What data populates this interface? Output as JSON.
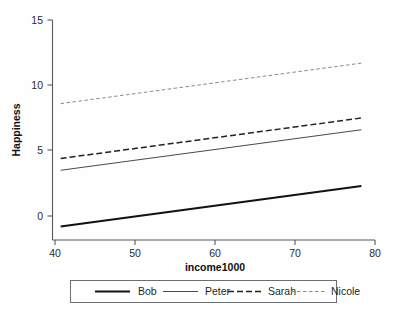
{
  "chart_data": {
    "type": "line",
    "title": "",
    "subtitle": "",
    "xlabel": "income1000",
    "ylabel": "Happiness",
    "xlim": [
      40,
      80
    ],
    "ylim": [
      -1.2,
      15
    ],
    "xticks": [
      40,
      50,
      60,
      70,
      80
    ],
    "yticks": [
      0,
      5,
      10,
      15
    ],
    "xtick_labels": [
      "40",
      "50",
      "60",
      "70",
      "80"
    ],
    "ytick_labels": [
      "0",
      "5",
      "10",
      "15"
    ],
    "grid": false,
    "legend_position": "bottom",
    "x_range_drawn": [
      40.7,
      78.3
    ],
    "series": [
      {
        "name": "Bob",
        "style": "solid",
        "width": 2.0,
        "color": "#111111",
        "x": [
          40.7,
          78.3
        ],
        "values": [
          -0.8,
          2.3
        ]
      },
      {
        "name": "Peter",
        "style": "solid",
        "width": 1.0,
        "color": "#4a4a4a",
        "x": [
          40.7,
          78.3
        ],
        "values": [
          3.5,
          6.6
        ]
      },
      {
        "name": "Sarah",
        "style": "dashed",
        "width": 1.5,
        "color": "#222222",
        "x": [
          40.7,
          78.3
        ],
        "values": [
          4.4,
          7.5
        ]
      },
      {
        "name": "Nicole",
        "style": "dotted",
        "width": 1.0,
        "color": "#8a8a8a",
        "x": [
          40.7,
          78.3
        ],
        "values": [
          8.6,
          11.7
        ]
      }
    ]
  },
  "axes": {
    "x_title": "income1000",
    "y_title": "Happiness",
    "x_tick_0": "40",
    "x_tick_1": "50",
    "x_tick_2": "60",
    "x_tick_3": "70",
    "x_tick_4": "80",
    "y_tick_0": "0",
    "y_tick_1": "5",
    "y_tick_2": "10",
    "y_tick_3": "15"
  },
  "legend": {
    "entries": [
      {
        "label": "Bob"
      },
      {
        "label": "Peter"
      },
      {
        "label": "Sarah"
      },
      {
        "label": "Nicole"
      }
    ]
  }
}
